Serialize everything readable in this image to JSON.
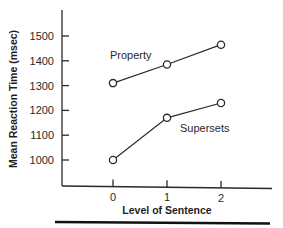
{
  "chart_data": {
    "type": "line",
    "title": "",
    "xlabel": "Level of Sentence",
    "ylabel": "Mean Reaction Time (msec)",
    "x": [
      0,
      1,
      2
    ],
    "x_tick_labels": [
      "0",
      "1",
      "2"
    ],
    "y_ticks": [
      1000,
      1100,
      1200,
      1300,
      1400,
      1500
    ],
    "y_tick_labels": [
      "1000",
      "1100",
      "1200",
      "1300",
      "1400",
      "1500"
    ],
    "ylim": [
      1000,
      1500
    ],
    "xlim": [
      0,
      2
    ],
    "grid": false,
    "legend": "inline labels",
    "series": [
      {
        "name": "Property",
        "values": [
          1310,
          1385,
          1465
        ],
        "marker": "open-circle",
        "label_position": "above-left of level 1"
      },
      {
        "name": "Supersets",
        "values": [
          1000,
          1170,
          1230
        ],
        "marker": "open-circle",
        "label_position": "below-right of level 1"
      }
    ],
    "colors": {
      "ink": "#2a2a2a",
      "background": "#ffffff"
    }
  }
}
